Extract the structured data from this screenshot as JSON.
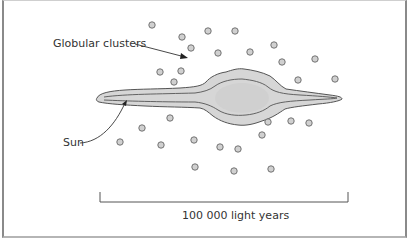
{
  "diagram": {
    "type": "galaxy-side-view",
    "labels": {
      "globular_clusters": "Globular clusters",
      "sun": "Sun",
      "scale": "100 000 light years"
    },
    "colors": {
      "disk_fill": "#d6d6d6",
      "outline": "#555555",
      "cluster_fill": "#d0d0d0",
      "cluster_stroke": "#666666",
      "text": "#333333",
      "scale_bar": "#555555"
    },
    "globular_clusters": [
      {
        "x": 152,
        "y": 25
      },
      {
        "x": 182,
        "y": 37
      },
      {
        "x": 208,
        "y": 31
      },
      {
        "x": 235,
        "y": 31
      },
      {
        "x": 274,
        "y": 45
      },
      {
        "x": 191,
        "y": 48
      },
      {
        "x": 218,
        "y": 53
      },
      {
        "x": 250,
        "y": 52
      },
      {
        "x": 282,
        "y": 62
      },
      {
        "x": 315,
        "y": 59
      },
      {
        "x": 298,
        "y": 80
      },
      {
        "x": 335,
        "y": 79
      },
      {
        "x": 160,
        "y": 72
      },
      {
        "x": 181,
        "y": 71
      },
      {
        "x": 174,
        "y": 82
      },
      {
        "x": 170,
        "y": 118
      },
      {
        "x": 142,
        "y": 128
      },
      {
        "x": 120,
        "y": 142
      },
      {
        "x": 161,
        "y": 145
      },
      {
        "x": 194,
        "y": 140
      },
      {
        "x": 220,
        "y": 147
      },
      {
        "x": 238,
        "y": 149
      },
      {
        "x": 268,
        "y": 122
      },
      {
        "x": 291,
        "y": 121
      },
      {
        "x": 309,
        "y": 123
      },
      {
        "x": 262,
        "y": 135
      },
      {
        "x": 195,
        "y": 167
      },
      {
        "x": 234,
        "y": 171
      },
      {
        "x": 271,
        "y": 169
      }
    ]
  }
}
